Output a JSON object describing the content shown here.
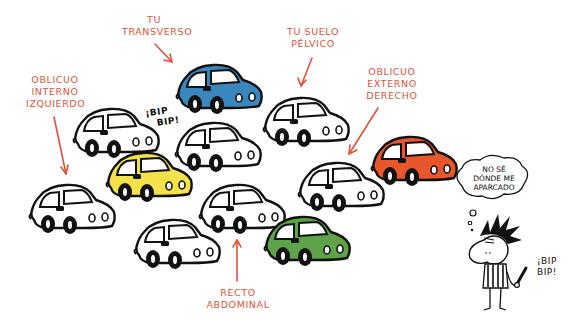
{
  "scene": {
    "description": "Cartoon illustration of a crowded parking lot where each car represents an abdominal muscle; a confused person with car keys can't find their car.",
    "colors": {
      "label_red": "#e0523a",
      "car_blue": "#3a86be",
      "car_yellow": "#f5e24a",
      "car_orange": "#e8562c",
      "car_green": "#5ea24a",
      "car_white": "#ffffff",
      "outline": "#111111"
    }
  },
  "labels": {
    "transverso": [
      "TU",
      "TRANSVERSO"
    ],
    "suelo_pelvico": [
      "TU SUELO",
      "PÉLVICO"
    ],
    "oblicuo_interno": [
      "OBLICUO",
      "INTERNO",
      "IZQUIERDO"
    ],
    "oblicuo_externo": [
      "OBLICUO",
      "EXTERNO",
      "DERECHO"
    ],
    "recto_abdominal": [
      "RECTO",
      "ABDOMINAL"
    ]
  },
  "sounds": {
    "bip_cars": [
      "¡BIP",
      "BIP!"
    ],
    "bip_person": [
      "¡BIP",
      "BIP!"
    ]
  },
  "thought_bubble": [
    "NO SÉ",
    "DÓNDE ME",
    "APARCADO"
  ],
  "cars": [
    {
      "id": "transverso",
      "color": "blue"
    },
    {
      "id": "suelo-pelvico",
      "color": "white"
    },
    {
      "id": "oblicuo-interno",
      "color": "white"
    },
    {
      "id": "recto-abdominal",
      "color": "white"
    },
    {
      "id": "oblicuo-externo",
      "color": "white"
    },
    {
      "id": "yellow",
      "color": "yellow"
    },
    {
      "id": "orange",
      "color": "orange"
    },
    {
      "id": "green",
      "color": "green"
    }
  ]
}
